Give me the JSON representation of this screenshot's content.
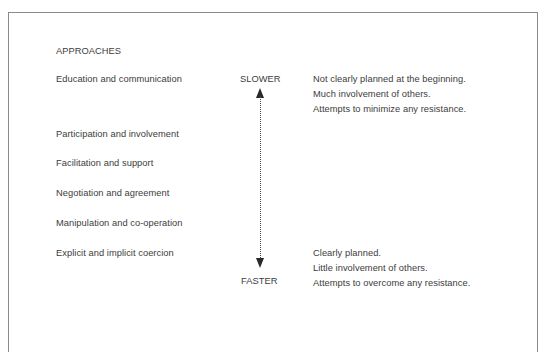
{
  "diagram": {
    "heading": "APPROACHES",
    "approaches": [
      "Education and communication",
      "Participation and involvement",
      "Facilitation and support",
      "Negotiation and agreement",
      "Manipulation and co-operation",
      "Explicit and implicit coercion"
    ],
    "axis": {
      "top_label": "SLOWER",
      "bottom_label": "FASTER",
      "arrow_style": "dotted double-headed vertical"
    },
    "slower_characteristics": [
      "Not clearly planned at the beginning.",
      "Much involvement of others.",
      "Attempts to minimize any resistance."
    ],
    "faster_characteristics": [
      "Clearly planned.",
      "Little involvement of others.",
      "Attempts to overcome any resistance."
    ]
  }
}
